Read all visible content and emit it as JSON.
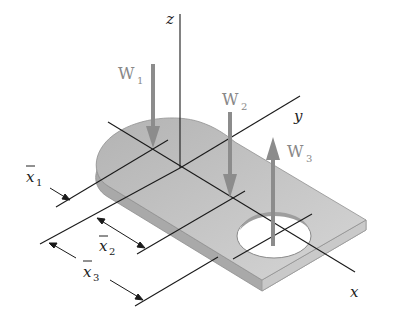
{
  "figure": {
    "colors": {
      "plate_top": "#bdbdbd",
      "plate_top_light": "#d2d2d2",
      "plate_edge": "#a8a8a8",
      "axis_line": "#1a1a1a",
      "force_arrow": "#8c8c8c",
      "background": "#ffffff"
    },
    "axes": {
      "z": "z",
      "y": "y",
      "x": "x"
    },
    "forces": [
      {
        "label": "W",
        "sub": "1",
        "direction": "down"
      },
      {
        "label": "W",
        "sub": "2",
        "direction": "down"
      },
      {
        "label": "W",
        "sub": "3",
        "direction": "up"
      }
    ],
    "dimensions": [
      {
        "label": "x",
        "sub": "1",
        "overbar": true
      },
      {
        "label": "x",
        "sub": "2",
        "overbar": true
      },
      {
        "label": "x",
        "sub": "3",
        "overbar": true
      }
    ]
  }
}
